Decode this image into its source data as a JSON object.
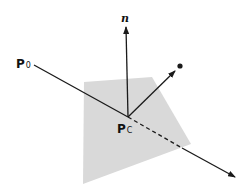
{
  "diagram": {
    "labels": {
      "p0": "P",
      "p0_sub": "0",
      "pc": "P",
      "pc_sub": "C",
      "normal": "n"
    },
    "colors": {
      "plane_fill": "#d9d9d9",
      "line": "#1a1a1a",
      "background": "#ffffff"
    },
    "geometry": {
      "plane_polygon": [
        [
          84,
          82
        ],
        [
          152,
          77
        ],
        [
          191,
          144
        ],
        [
          83,
          184
        ]
      ],
      "intersection_point": [
        128,
        117
      ],
      "ray_start": [
        34,
        65
      ],
      "ray_dashed_end": [
        182,
        148
      ],
      "ray_arrow_end": [
        235,
        177
      ],
      "normal_arrow_end": [
        126,
        27
      ],
      "reflection_arrow_end": [
        175,
        71
      ],
      "reflection_dot": [
        180,
        66
      ]
    }
  }
}
